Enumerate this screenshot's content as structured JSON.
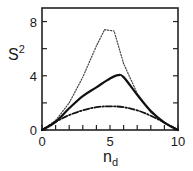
{
  "chart_data": {
    "type": "line",
    "title": "",
    "xlabel": "n_d",
    "ylabel": "S^2",
    "xlabel_main": "n",
    "xlabel_sub": "d",
    "ylabel_main": "S",
    "ylabel_sup": "2",
    "xlim": [
      0,
      10
    ],
    "ylim": [
      0,
      9
    ],
    "x_ticks": [
      0,
      5,
      10
    ],
    "x_minor_ticks": [
      1,
      2,
      3,
      4,
      6,
      7,
      8,
      9
    ],
    "y_ticks": [
      0,
      4,
      8
    ],
    "y_minor_ticks": [
      2,
      6
    ],
    "grid": false,
    "legend": null,
    "series": [
      {
        "name": "dotted",
        "style": "dotted",
        "x": [
          0,
          1,
          2,
          3,
          4,
          4.6,
          5.3,
          6,
          7,
          8,
          9,
          10
        ],
        "y": [
          0,
          0.7,
          2.0,
          3.9,
          6.2,
          7.4,
          7.3,
          4.9,
          2.7,
          1.3,
          0.5,
          0
        ]
      },
      {
        "name": "solid",
        "style": "solid",
        "x": [
          0,
          1,
          2,
          3,
          4,
          5,
          5.6,
          6,
          7,
          8,
          9,
          10
        ],
        "y": [
          0,
          0.6,
          1.6,
          2.5,
          3.15,
          3.8,
          4.05,
          3.9,
          2.6,
          1.4,
          0.55,
          0
        ]
      },
      {
        "name": "dash-dot",
        "style": "dash-dot",
        "x": [
          0,
          1,
          2,
          3,
          4,
          5,
          6,
          7,
          8,
          9,
          10
        ],
        "y": [
          0,
          0.6,
          1.1,
          1.45,
          1.68,
          1.75,
          1.68,
          1.45,
          1.05,
          0.55,
          0
        ]
      }
    ]
  }
}
